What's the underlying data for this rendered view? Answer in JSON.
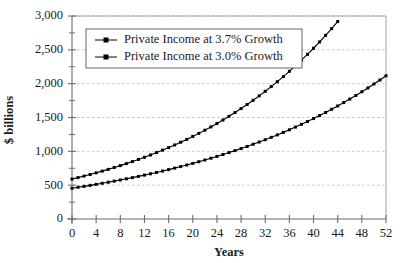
{
  "chart_data": {
    "type": "line",
    "title": "",
    "xlabel": "Years",
    "ylabel": "$ billions",
    "xlim": [
      0,
      52
    ],
    "ylim": [
      0,
      3000
    ],
    "grid": true,
    "legend_position": "top-left-inside",
    "x": [
      0,
      1,
      2,
      3,
      4,
      5,
      6,
      7,
      8,
      9,
      10,
      11,
      12,
      13,
      14,
      15,
      16,
      17,
      18,
      19,
      20,
      21,
      22,
      23,
      24,
      25,
      26,
      27,
      28,
      29,
      30,
      31,
      32,
      33,
      34,
      35,
      36,
      37,
      38,
      39,
      40,
      41,
      42,
      43,
      44,
      45,
      46,
      47,
      48,
      49,
      50,
      51,
      52
    ],
    "xticks": [
      "0",
      "4",
      "8",
      "12",
      "16",
      "20",
      "24",
      "28",
      "32",
      "36",
      "40",
      "44",
      "48",
      "52"
    ],
    "xtick_values": [
      0,
      4,
      8,
      12,
      16,
      20,
      24,
      28,
      32,
      36,
      40,
      44,
      48,
      52
    ],
    "yticks": [
      "0",
      "500",
      "1,000",
      "1,500",
      "2,000",
      "2,500",
      "3,000"
    ],
    "ytick_values": [
      0,
      500,
      1000,
      1500,
      2000,
      2500,
      3000
    ],
    "series": [
      {
        "name": "Private Income at 3.7% Growth",
        "growth_rate_percent": 3.7,
        "start_value": 590,
        "end_value": 2749,
        "marker": "square",
        "color": "#000000",
        "values": [
          590,
          612,
          634,
          658,
          682,
          707,
          733,
          760,
          788,
          817,
          848,
          879,
          911,
          945,
          980,
          1016,
          1054,
          1093,
          1133,
          1175,
          1218,
          1263,
          1310,
          1358,
          1408,
          1460,
          1514,
          1570,
          1628,
          1688,
          1751,
          1816,
          1883,
          1953,
          2025,
          2100,
          2178,
          2258,
          2342,
          2428,
          2518,
          2611,
          2708,
          2808,
          2912,
          3019,
          3131,
          3247,
          3367,
          3491,
          3620,
          3754,
          2749
        ]
      },
      {
        "name": "Private Income at 3.0% Growth",
        "growth_rate_percent": 3.0,
        "start_value": 455,
        "end_value": 2155,
        "marker": "square",
        "color": "#000000",
        "values": [
          455,
          469,
          483,
          497,
          512,
          528,
          544,
          560,
          577,
          594,
          612,
          630,
          649,
          669,
          689,
          709,
          731,
          753,
          775,
          798,
          822,
          847,
          872,
          899,
          925,
          953,
          982,
          1011,
          1042,
          1073,
          1105,
          1138,
          1172,
          1208,
          1244,
          1281,
          1319,
          1359,
          1400,
          1442,
          1485,
          1530,
          1575,
          1623,
          1671,
          1721,
          1773,
          1826,
          1881,
          1937,
          1995,
          2055,
          2116
        ]
      }
    ]
  },
  "axes": {
    "x_axis_title": "Years",
    "y_axis_title": "$ billions"
  },
  "legend": {
    "entries": [
      {
        "label": "Private Income at 3.7% Growth"
      },
      {
        "label": "Private Income at 3.0% Growth"
      }
    ]
  },
  "colors": {
    "series": "#000000",
    "gridline": "#b9b9b9",
    "axis": "#6d6d6d",
    "background": "#ffffff",
    "text": "#1a1a1a"
  }
}
